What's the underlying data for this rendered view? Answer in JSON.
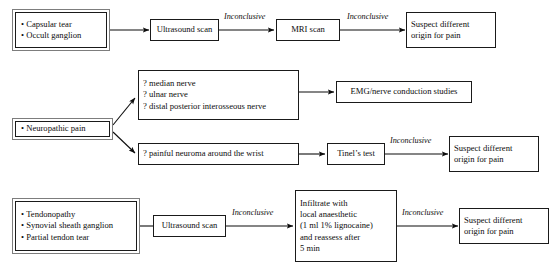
{
  "diagram": {
    "edge_label_default": "Inconclusive",
    "colors": {
      "ink": "#0d0d0d",
      "box_border": "#1a1a1a",
      "outer_border": "#7d7d7d",
      "background": "#ffffff"
    }
  },
  "rows": {
    "row1": {
      "source": {
        "items": [
          "Capsular tear",
          "Occult ganglion"
        ]
      },
      "step1": {
        "label": "Ultrasound scan"
      },
      "step2": {
        "label": "MRI scan"
      },
      "outcome": {
        "line1": "Suspect different",
        "line2": "origin for pain"
      },
      "edges": {
        "e1": "Inconclusive",
        "e2": "Inconclusive"
      }
    },
    "row2": {
      "source": {
        "items": [
          "Neuropathic pain"
        ]
      },
      "branch_a": {
        "items": [
          "? median nerve",
          "? ulnar nerve",
          "? distal posterior interosseous nerve"
        ],
        "next": {
          "label": "EMG/nerve conduction studies"
        }
      },
      "branch_b": {
        "items": [
          "? painful neuroma around the wrist"
        ],
        "next": {
          "label": "Tinel’s test"
        },
        "edge": "Inconclusive",
        "outcome": {
          "line1": "Suspect different",
          "line2": "origin for pain"
        }
      }
    },
    "row3": {
      "source": {
        "items": [
          "Tendonopathy",
          "Synovial sheath ganglion",
          "Partial tendon tear"
        ]
      },
      "step1": {
        "label": "Ultrasound scan"
      },
      "step2": {
        "lines": [
          "Infiltrate with",
          "local anaesthetic",
          "(1 ml 1% lignocaine)",
          "and reassess after",
          "5 min"
        ]
      },
      "outcome": {
        "line1": "Suspect different",
        "line2": "origin for pain"
      },
      "edges": {
        "e1": "Inconclusive",
        "e2": "Inconclusive"
      }
    }
  }
}
